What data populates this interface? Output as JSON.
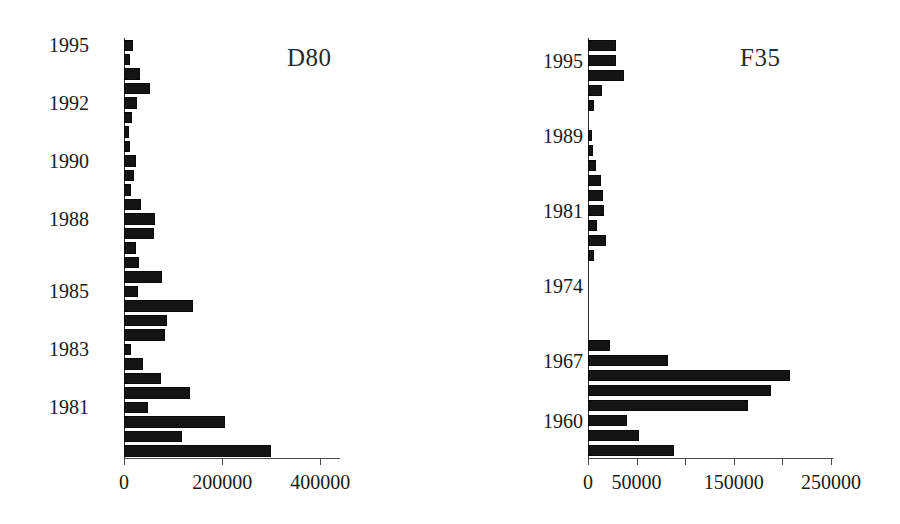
{
  "figure": {
    "background": "#ffffff",
    "bar_color": "#141414",
    "axis_color": "#4a4a4a",
    "panel_count": 2
  },
  "chart_data": [
    {
      "type": "bar",
      "orientation": "horizontal",
      "title": "D80",
      "xlabel": "",
      "ylabel": "",
      "xlim": [
        0,
        440000
      ],
      "grid": false,
      "legend": null,
      "xticks": [
        0,
        200000,
        400000
      ],
      "xtick_labels": [
        "0",
        "200000",
        "400000"
      ],
      "ytick_labels": [
        "1995",
        "1992",
        "1990",
        "1988",
        "1985",
        "1983",
        "1981"
      ],
      "ytick_positions": [
        0,
        4,
        8,
        12,
        17,
        21,
        25
      ],
      "categories": [
        "1995",
        "1994",
        "1993",
        "1992b",
        "1992",
        "1991b",
        "1991",
        "1990b",
        "1990",
        "1989b",
        "1989",
        "1988b",
        "1988",
        "1987b",
        "1987",
        "1986b",
        "1986",
        "1985b",
        "1985",
        "1984b",
        "1984",
        "1983b",
        "1983",
        "1982b",
        "1982",
        "1981"
      ],
      "values": [
        18000,
        13000,
        33000,
        52000,
        27000,
        18000,
        11000,
        13000,
        24000,
        20000,
        15000,
        35000,
        63000,
        62000,
        25000,
        30000,
        78000,
        30000,
        140000,
        88000,
        85000,
        15000,
        38000,
        75000,
        135000,
        48000
      ],
      "values_note": "widths estimated from pixel extents against 0/200000/400000 ticks"
    },
    {
      "type": "bar",
      "orientation": "horizontal",
      "title": "F35",
      "xlabel": "",
      "ylabel": "",
      "xlim": [
        0,
        265000
      ],
      "grid": false,
      "legend": null,
      "xticks": [
        0,
        50000,
        100000,
        150000,
        200000,
        250000
      ],
      "xtick_labels": [
        "0",
        "50000",
        "",
        "150000",
        "",
        "250000"
      ],
      "ytick_labels": [
        "1995",
        "1989",
        "1981",
        "1974",
        "1967",
        "1960"
      ],
      "ytick_positions": [
        1,
        6,
        11,
        16,
        21,
        25
      ],
      "categories": [
        "1996",
        "1995",
        "1994",
        "1993",
        "1992",
        "1991",
        "1990",
        "1989",
        "1988",
        "1987",
        "1986",
        "1985",
        "1984",
        "1983",
        "1982",
        "1981",
        "1980",
        "1979",
        "1974",
        "1970",
        "1969",
        "1968",
        "1967",
        "1966",
        "1965",
        "1960"
      ],
      "values": [
        29000,
        29000,
        36000,
        20000,
        6000,
        0,
        5000,
        7000,
        8000,
        13000,
        15000,
        16000,
        9000,
        18000,
        6000,
        0,
        0,
        0,
        0,
        0,
        0,
        0,
        0,
        0,
        0,
        0
      ],
      "values_note": "upper block only; see values_full for the plotted series"
    }
  ],
  "panels": [
    {
      "id": "left",
      "title": "D80",
      "axis": {
        "ticks": [
          {
            "value": 0,
            "label": "0"
          },
          {
            "value": 200000,
            "label": "200000"
          },
          {
            "value": 400000,
            "label": "400000"
          }
        ],
        "max": 440000
      },
      "year_labels": [
        {
          "label": "1995",
          "index": 0
        },
        {
          "label": "1992",
          "index": 4
        },
        {
          "label": "1990",
          "index": 8
        },
        {
          "label": "1988",
          "index": 12
        },
        {
          "label": "1985",
          "index": 17
        },
        {
          "label": "1983",
          "index": 21
        },
        {
          "label": "1981",
          "index": 25
        }
      ],
      "bars": [
        18000,
        12000,
        33000,
        52000,
        27000,
        17000,
        11000,
        12000,
        24000,
        20000,
        14000,
        34000,
        63000,
        62000,
        24000,
        30000,
        78000,
        29000,
        140000,
        88000,
        84000,
        14000,
        38000,
        75000,
        135000,
        48000,
        205000,
        118000,
        300000
      ]
    },
    {
      "id": "right",
      "title": "F35",
      "axis": {
        "ticks": [
          {
            "value": 0,
            "label": "0"
          },
          {
            "value": 50000,
            "label": "50000"
          },
          {
            "value": 100000,
            "label": ""
          },
          {
            "value": 150000,
            "label": "150000"
          },
          {
            "value": 200000,
            "label": ""
          },
          {
            "value": 250000,
            "label": "250000"
          }
        ],
        "max": 252000
      },
      "year_labels": [
        {
          "label": "1995",
          "index": 1
        },
        {
          "label": "1989",
          "index": 6
        },
        {
          "label": "1981",
          "index": 11
        },
        {
          "label": "1974",
          "index": 16
        },
        {
          "label": "1967",
          "index": 21
        },
        {
          "label": "1960",
          "index": 25
        }
      ],
      "bars": [
        29000,
        29000,
        37000,
        14000,
        6000,
        0,
        4000,
        5000,
        8000,
        13000,
        15000,
        16000,
        9000,
        18000,
        6000,
        0,
        0,
        0,
        0,
        0,
        23000,
        82000,
        208000,
        188000,
        165000,
        40000,
        52000,
        88000
      ]
    }
  ]
}
